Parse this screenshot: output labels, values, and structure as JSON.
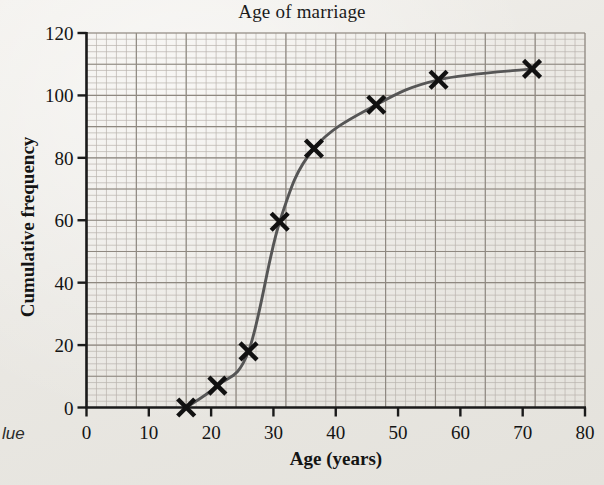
{
  "figure": {
    "margin_text": "lue",
    "paper_color": "#eceae6",
    "curve_color": "#565656",
    "marker_color": "#111111",
    "axis_color": "#1a1a1a",
    "grid_minor_color": "#b9b3ad",
    "grid_major_color": "#8e8880"
  },
  "chart_data": {
    "type": "line",
    "title": "Age of marriage",
    "xlabel": "Age (years)",
    "ylabel": "Cumulative frequency",
    "xlim": [
      0,
      80
    ],
    "ylim": [
      0,
      120
    ],
    "xticks": [
      0,
      10,
      20,
      30,
      40,
      50,
      60,
      70,
      80
    ],
    "yticks": [
      0,
      20,
      40,
      60,
      80,
      100,
      120
    ],
    "xtick_labels": [
      "0",
      "10",
      "20",
      "30",
      "40",
      "50",
      "60",
      "70",
      "80"
    ],
    "ytick_labels": [
      "0",
      "20",
      "40",
      "60",
      "80",
      "100",
      "120"
    ],
    "grid": true,
    "grid_minor_step_x": 1.6,
    "grid_minor_step_y": 2,
    "grid_major_step_x": 8,
    "grid_major_step_y": 10,
    "legend": null,
    "marker": "x",
    "series": [
      {
        "name": "Cumulative frequency",
        "x": [
          16,
          21,
          26,
          31,
          36.5,
          46.5,
          56.5,
          71.5
        ],
        "y": [
          0,
          7,
          18,
          59.5,
          83,
          97,
          105,
          108.5
        ]
      }
    ]
  }
}
